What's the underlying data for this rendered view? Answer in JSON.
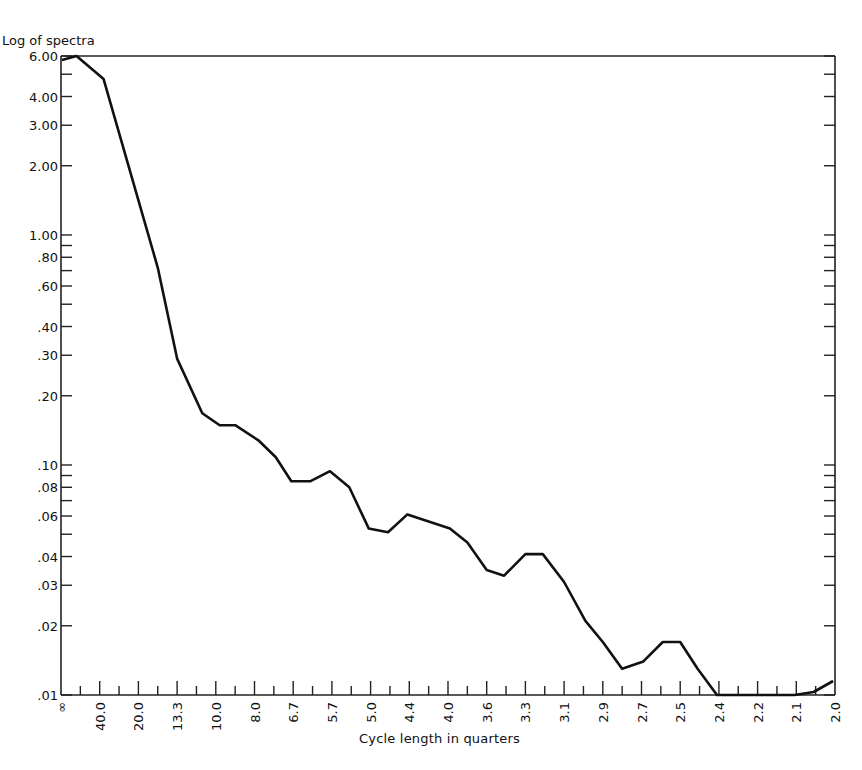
{
  "chart_data": {
    "type": "line",
    "title": "",
    "ylabel": "Log of spectra",
    "xlabel": "Cycle length in quarters",
    "yscale": "log",
    "ylim": [
      0.01,
      6.0
    ],
    "grid": false,
    "legend": null,
    "y_ticks": [
      {
        "label": "6.00",
        "value": 6.0
      },
      {
        "label": "4.00",
        "value": 4.0
      },
      {
        "label": "3.00",
        "value": 3.0
      },
      {
        "label": "2.00",
        "value": 2.0
      },
      {
        "label": "1.00",
        "value": 1.0
      },
      {
        "label": ".80",
        "value": 0.8
      },
      {
        "label": ".60",
        "value": 0.6
      },
      {
        "label": ".40",
        "value": 0.4
      },
      {
        "label": ".30",
        "value": 0.3
      },
      {
        "label": ".20",
        "value": 0.2
      },
      {
        "label": ".10",
        "value": 0.1
      },
      {
        "label": ".08",
        "value": 0.08
      },
      {
        "label": ".06",
        "value": 0.06
      },
      {
        "label": ".04",
        "value": 0.04
      },
      {
        "label": ".03",
        "value": 0.03
      },
      {
        "label": ".02",
        "value": 0.02
      },
      {
        "label": ".01",
        "value": 0.01
      }
    ],
    "y_minor_ticks": [
      5.0,
      0.9,
      0.7,
      0.5,
      0.09,
      0.07,
      0.05
    ],
    "x_tick_labels": [
      "∞",
      "40.0",
      "20.0",
      "13.3",
      "10.0",
      "8.0",
      "6.7",
      "5.7",
      "5.0",
      "4.4",
      "4.0",
      "3.6",
      "3.3",
      "3.1",
      "2.9",
      "2.7",
      "2.5",
      "2.4",
      "2.2",
      "2.1",
      "2.0"
    ],
    "x_frequency_index": [
      0,
      2,
      4,
      6,
      8,
      10,
      12,
      14,
      16,
      18,
      20,
      22,
      24,
      26,
      28,
      30,
      32,
      34,
      36,
      38,
      40
    ],
    "series": [
      {
        "name": "Spectrum",
        "x": [
          0.05,
          0.8,
          2.2,
          5.0,
          6.0,
          7.3,
          8.2,
          9.0,
          10.2,
          11.1,
          11.9,
          12.9,
          13.9,
          14.9,
          15.9,
          16.9,
          17.9,
          20.1,
          21.0,
          22.0,
          22.9,
          24.0,
          24.9,
          26.0,
          27.1,
          28.0,
          29.0,
          30.1,
          31.1,
          32.0,
          32.9,
          33.9,
          37.9,
          38.9,
          39.9
        ],
        "values": [
          5.76,
          6.0,
          4.76,
          0.72,
          0.29,
          0.168,
          0.149,
          0.149,
          0.128,
          0.108,
          0.085,
          0.085,
          0.094,
          0.08,
          0.053,
          0.051,
          0.061,
          0.053,
          0.046,
          0.035,
          0.033,
          0.041,
          0.041,
          0.031,
          0.021,
          0.017,
          0.013,
          0.014,
          0.017,
          0.017,
          0.013,
          0.01,
          0.01,
          0.0103,
          0.0115
        ]
      }
    ]
  }
}
